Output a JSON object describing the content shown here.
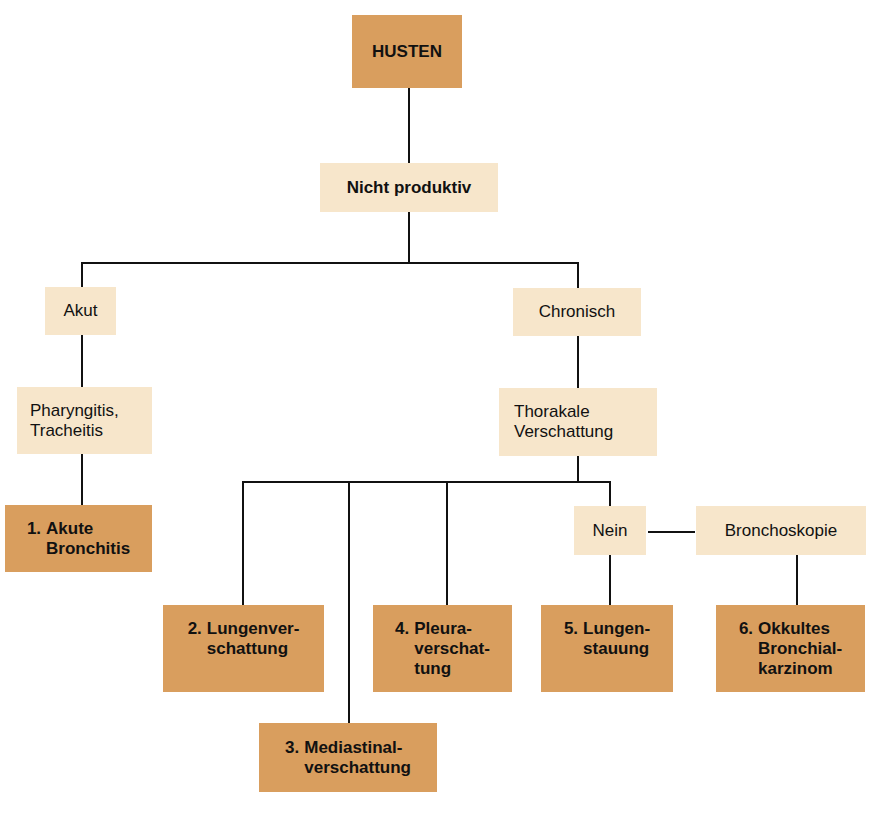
{
  "diagram": {
    "root": {
      "label": "HUSTEN"
    },
    "level1": {
      "label": "Nicht produktiv"
    },
    "branches": {
      "acute": {
        "label": "Akut"
      },
      "chronic": {
        "label": "Chronisch"
      }
    },
    "acute_cause": {
      "label": "Pharyngitis,\nTracheitis"
    },
    "chronic_finding": {
      "label": "Thorakale\nVerschattung"
    },
    "no_node": {
      "label": "Nein"
    },
    "bronchoscopy": {
      "label": "Bronchoskopie"
    },
    "outcomes": [
      {
        "num": "1.",
        "label": "Akute\nBronchitis"
      },
      {
        "num": "2.",
        "label": "Lungenver-\nschattung"
      },
      {
        "num": "3.",
        "label": "Mediastinal-\nverschattung"
      },
      {
        "num": "4.",
        "label": "Pleura-\nverschat-\ntung"
      },
      {
        "num": "5.",
        "label": "Lungen-\nstauung"
      },
      {
        "num": "6.",
        "label": "Okkultes\nBronchial-\nkarzinom"
      }
    ],
    "colors": {
      "outcome_box": "#d99e5e",
      "step_box": "#f7e6cb",
      "lines": "#111111"
    }
  }
}
